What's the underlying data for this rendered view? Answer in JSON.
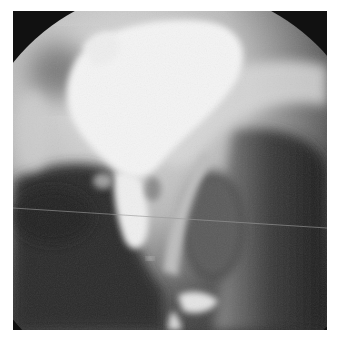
{
  "image": {
    "kind": "radiograph",
    "description": "Fluoroscopic contrast study: circular collimated field with bright opacified bladder and narrow contrast-filled channel descending toward the bottom; dark soft-tissue regions lower left and right; faint horizontal line artifact across the field.",
    "colors": {
      "border": "#ffffff",
      "collimator_black": "#111111",
      "contrast_white": "#f4f4f4",
      "soft_tissue_dark": "#2a2a2a",
      "mid_gray": "#7a7a7a"
    }
  }
}
